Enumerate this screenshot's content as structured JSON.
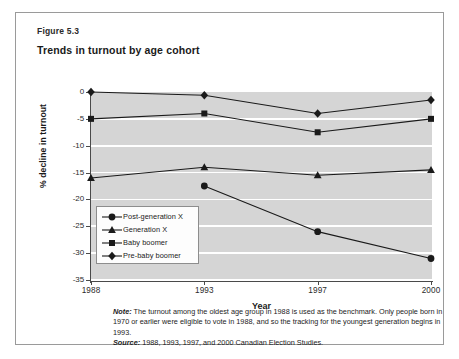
{
  "figure": {
    "number": "Figure 5.3",
    "title": "Trends in turnout by age cohort"
  },
  "notes": {
    "note_label": "Note:",
    "note_text": " The turnout among the oldest age group in 1988 is used as the benchmark. Only people born in 1970 or earlier were eligible to vote in 1988, and so the tracking for the youngest generation begins in 1993.",
    "source_label": "Source:",
    "source_text": " 1988, 1993, 1997, and 2000 Canadian Election Studies."
  },
  "chart_data": {
    "type": "line",
    "title": "Trends in turnout by age cohort",
    "xlabel": "Year",
    "ylabel": "% decline in turnout",
    "x": [
      1988,
      1993,
      1997,
      2000
    ],
    "xtick_labels": [
      "1988",
      "1993",
      "1997",
      "2000"
    ],
    "ytick_labels": [
      "0",
      "-5",
      "-10",
      "-15",
      "-20",
      "-25",
      "-30",
      "-35"
    ],
    "ytick_values": [
      0,
      -5,
      -10,
      -15,
      -20,
      -25,
      -30,
      -35
    ],
    "ylim": [
      -35,
      0
    ],
    "grid": "horizontal",
    "legend_position": "lower-left-inside",
    "plot_background": "#d5d5d5",
    "gridline_color": "#ffffff",
    "series_color": "#1a1a1a",
    "series": [
      {
        "name": "Post-generation X",
        "marker": "circle",
        "x": [
          1993,
          1997,
          2000
        ],
        "values": [
          -17.5,
          -26.0,
          -31.0
        ]
      },
      {
        "name": "Generation X",
        "marker": "triangle",
        "x": [
          1988,
          1993,
          1997,
          2000
        ],
        "values": [
          -16.0,
          -14.0,
          -15.5,
          -14.5
        ]
      },
      {
        "name": "Baby boomer",
        "marker": "square",
        "x": [
          1988,
          1993,
          1997,
          2000
        ],
        "values": [
          -5.0,
          -4.0,
          -7.5,
          -5.0
        ]
      },
      {
        "name": "Pre-baby boomer",
        "marker": "diamond",
        "x": [
          1988,
          1993,
          1997,
          2000
        ],
        "values": [
          0.0,
          -0.6,
          -4.0,
          -1.5
        ]
      }
    ]
  }
}
